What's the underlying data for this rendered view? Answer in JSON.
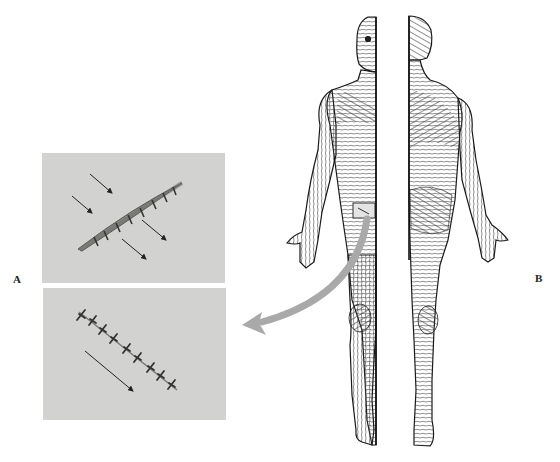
{
  "labels": {
    "panel_a": "A",
    "panel_b": "B"
  },
  "panel_a": {
    "top_photo": {
      "description": "sutured incision oriented across skin tension lines, gaping wound",
      "arrows": 4
    },
    "bottom_photo": {
      "description": "sutured incision oriented parallel to skin tension lines, tight closure",
      "arrows": 1,
      "sutures": 9
    }
  },
  "panel_b": {
    "description": "Human figure showing skin tension (Langer's) lines, front half and back half views",
    "views": [
      "anterior",
      "posterior"
    ],
    "marked_region": "hip/thigh rectangle with incision"
  },
  "connector_arrow": {
    "color": "#a9a9a9",
    "from": "marked region on thigh",
    "to": "panel A"
  },
  "colors": {
    "photo_bg": "#d2d2d0",
    "line_art": "#2a2a2a",
    "arrow": "#a9a9a9"
  }
}
